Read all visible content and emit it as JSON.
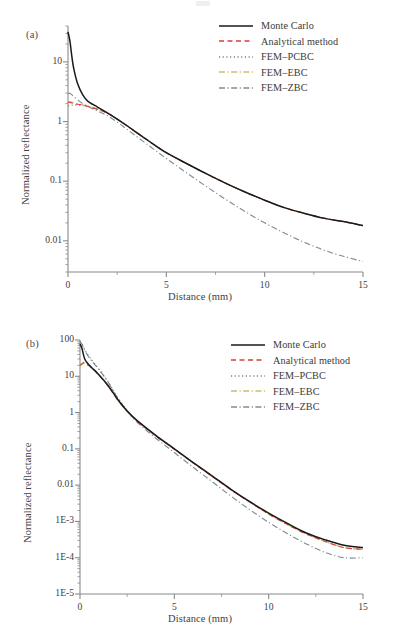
{
  "figure": {
    "background_color": "#ffffff",
    "panels": [
      {
        "label": "(a)",
        "xlabel": "Distance (mm)",
        "ylabel": "Normalized reflectance",
        "xticks": [
          "0",
          "5",
          "10",
          "15"
        ],
        "yticks": [
          "10",
          "1",
          "0.1",
          "0.01"
        ]
      },
      {
        "label": "(b)",
        "xlabel": "Distance (mm)",
        "ylabel": "Normalized reflectance",
        "xticks": [
          "0",
          "5",
          "10",
          "15"
        ],
        "yticks": [
          "100",
          "10",
          "1",
          "0.1",
          "0.01",
          "1E-3",
          "1E-4",
          "1E-5"
        ]
      }
    ],
    "legend": [
      {
        "label": "Monte Carlo",
        "style": "solid",
        "color": "#1a1a1a"
      },
      {
        "label": "Analytical method",
        "style": "dashed",
        "color": "#d6403a"
      },
      {
        "label": "FEM-PCBC",
        "style": "dotted",
        "color": "#6f7d6a"
      },
      {
        "label": "FEM-EBC",
        "style": "dashdot",
        "color": "#c9c06a"
      },
      {
        "label": "FEM-ZBC",
        "style": "dashdot",
        "color": "#7e8e96"
      }
    ]
  },
  "chart_data": [
    {
      "type": "line",
      "title": "",
      "panel": "(a)",
      "xlabel": "Distance (mm)",
      "ylabel": "Normalized reflectance",
      "xlim": [
        0,
        15
      ],
      "ylim": [
        0.003,
        40
      ],
      "yscale": "log",
      "xscale": "linear",
      "grid": false,
      "legend_position": "top-right",
      "xticks": [
        0,
        5,
        10,
        15
      ],
      "yticks": [
        10,
        1,
        0.1,
        0.01
      ],
      "x": [
        0,
        0.1,
        0.2,
        0.3,
        0.5,
        0.75,
        1,
        1.5,
        2,
        2.5,
        3,
        4,
        5,
        6,
        7,
        8,
        9,
        10,
        11,
        12,
        13,
        14,
        15
      ],
      "series": [
        {
          "name": "Monte Carlo",
          "color": "#1a1a1a",
          "style": "solid",
          "values": [
            32,
            22,
            12,
            7.5,
            4.2,
            2.8,
            2.2,
            1.75,
            1.4,
            1.1,
            0.85,
            0.5,
            0.3,
            0.2,
            0.135,
            0.093,
            0.066,
            0.048,
            0.036,
            0.029,
            0.024,
            0.021,
            0.018
          ]
        },
        {
          "name": "Analytical method",
          "color": "#d6403a",
          "style": "dashed",
          "values": [
            2.1,
            2.1,
            2.05,
            2.0,
            1.95,
            1.88,
            1.8,
            1.6,
            1.38,
            1.1,
            0.85,
            0.5,
            0.3,
            0.2,
            0.135,
            0.093,
            0.066,
            0.048,
            0.036,
            0.029,
            0.024,
            0.021,
            0.018
          ]
        },
        {
          "name": "FEM-PCBC",
          "color": "#6f7d6a",
          "style": "dotted",
          "values": [
            1.85,
            1.87,
            1.88,
            1.9,
            1.9,
            1.85,
            1.78,
            1.6,
            1.38,
            1.1,
            0.85,
            0.5,
            0.3,
            0.2,
            0.135,
            0.093,
            0.066,
            0.048,
            0.036,
            0.029,
            0.024,
            0.021,
            0.018
          ]
        },
        {
          "name": "FEM-EBC",
          "color": "#c9c06a",
          "style": "dashdot",
          "values": [
            2.15,
            2.15,
            2.1,
            2.05,
            1.98,
            1.9,
            1.82,
            1.62,
            1.39,
            1.1,
            0.85,
            0.5,
            0.3,
            0.2,
            0.135,
            0.093,
            0.066,
            0.048,
            0.036,
            0.029,
            0.024,
            0.021,
            0.018
          ]
        },
        {
          "name": "FEM-ZBC",
          "color": "#7e8e96",
          "style": "dashdot",
          "values": [
            3.0,
            2.95,
            2.8,
            2.6,
            2.3,
            2.0,
            1.8,
            1.5,
            1.25,
            0.98,
            0.74,
            0.42,
            0.24,
            0.14,
            0.083,
            0.05,
            0.031,
            0.02,
            0.0135,
            0.0095,
            0.007,
            0.0055,
            0.0045
          ]
        }
      ]
    },
    {
      "type": "line",
      "title": "",
      "panel": "(b)",
      "xlabel": "Distance (mm)",
      "ylabel": "Normalized reflectance",
      "xlim": [
        0,
        15
      ],
      "ylim": [
        1e-05,
        100
      ],
      "yscale": "log",
      "xscale": "linear",
      "grid": false,
      "legend_position": "top-right",
      "xticks": [
        0,
        5,
        10,
        15
      ],
      "yticks": [
        100,
        10,
        1,
        0.1,
        0.01,
        0.001,
        0.0001,
        1e-05
      ],
      "x": [
        0,
        0.1,
        0.25,
        0.5,
        0.75,
        1,
        1.5,
        2,
        2.5,
        3,
        4,
        5,
        6,
        7,
        8,
        9,
        10,
        11,
        12,
        13,
        14,
        15
      ],
      "series": [
        {
          "name": "Monte Carlo",
          "color": "#1a1a1a",
          "style": "solid",
          "values": [
            78,
            60,
            30,
            20,
            15,
            11,
            5.5,
            2.3,
            1.1,
            0.62,
            0.24,
            0.1,
            0.042,
            0.018,
            0.0077,
            0.0035,
            0.0017,
            0.00088,
            0.00048,
            0.00031,
            0.00022,
            0.00019
          ]
        },
        {
          "name": "Analytical method",
          "color": "#d6403a",
          "style": "dashed",
          "values": [
            20,
            22,
            24,
            19,
            15,
            11,
            5.3,
            2.25,
            1.08,
            0.6,
            0.23,
            0.098,
            0.041,
            0.0175,
            0.0075,
            0.0034,
            0.0016,
            0.00082,
            0.00045,
            0.00028,
            0.00019,
            0.00017
          ]
        },
        {
          "name": "FEM-PCBC",
          "color": "#6f7d6a",
          "style": "dotted",
          "values": [
            90,
            80,
            55,
            34,
            23,
            16,
            7,
            2.6,
            1.15,
            0.6,
            0.23,
            0.098,
            0.041,
            0.0175,
            0.0075,
            0.0034,
            0.0016,
            0.00082,
            0.00045,
            0.00028,
            0.00019,
            0.00017
          ]
        },
        {
          "name": "FEM-EBC",
          "color": "#c9c06a",
          "style": "dashdot",
          "values": [
            19,
            21,
            23,
            18.5,
            14.5,
            10.8,
            5.2,
            2.22,
            1.07,
            0.6,
            0.23,
            0.098,
            0.041,
            0.0175,
            0.0075,
            0.0034,
            0.0016,
            0.00082,
            0.00045,
            0.00028,
            0.00019,
            0.00017
          ]
        },
        {
          "name": "FEM-ZBC",
          "color": "#7e8e96",
          "style": "dashdot",
          "values": [
            88,
            78,
            52,
            32,
            22,
            15.5,
            6.8,
            2.5,
            1.1,
            0.56,
            0.2,
            0.079,
            0.031,
            0.0125,
            0.005,
            0.0021,
            0.00095,
            0.00046,
            0.00024,
            0.00014,
            0.0001,
            0.0001
          ]
        }
      ]
    }
  ]
}
